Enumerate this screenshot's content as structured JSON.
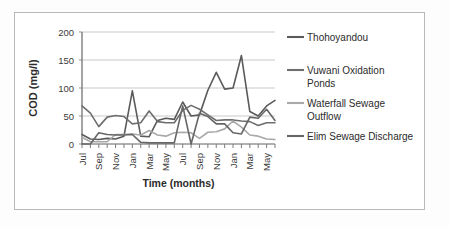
{
  "figure": {
    "background_color": "#ffffff",
    "frame_color": "#b9b9b9",
    "gridline_color": "#c9c9c9",
    "axis_color": "#8f8f8f"
  },
  "chart_data": {
    "type": "line",
    "title": "",
    "xlabel": "Time (months)",
    "ylabel": "COD (mg/l)",
    "ylim": [
      0,
      200
    ],
    "yticks": [
      0,
      50,
      100,
      150,
      200
    ],
    "grid": true,
    "legend_position": "right",
    "x": [
      "Jul",
      "Aug",
      "Sep",
      "Oct",
      "Nov",
      "Dec",
      "Jan",
      "Feb",
      "Mar",
      "Apr",
      "May",
      "Jun",
      "Jul",
      "Aug",
      "Sep",
      "Oct",
      "Nov",
      "Dec",
      "Jan",
      "Feb",
      "Mar",
      "Apr",
      "May",
      "Jun"
    ],
    "xtick_labels": [
      "Jul",
      "Sep",
      "Nov",
      "Jan",
      "Mar",
      "May",
      "Jul",
      "Sep",
      "Nov",
      "Jan",
      "Mar",
      "May"
    ],
    "xtick_indices": [
      0,
      2,
      4,
      6,
      8,
      10,
      12,
      14,
      16,
      18,
      20,
      22
    ],
    "series": [
      {
        "name": "Thohoyandou",
        "color": "#5a5a5a",
        "values": [
          17,
          9,
          8,
          10,
          9,
          14,
          95,
          14,
          13,
          42,
          46,
          44,
          75,
          50,
          52,
          96,
          128,
          98,
          100,
          158,
          58,
          50,
          68,
          78
        ]
      },
      {
        "name": "Vuwani Oxidation Ponds",
        "color": "#6e6e6e",
        "values": [
          68,
          55,
          31,
          48,
          51,
          49,
          36,
          38,
          59,
          40,
          38,
          38,
          60,
          69,
          62,
          52,
          42,
          43,
          43,
          41,
          40,
          33,
          38,
          38
        ]
      },
      {
        "name": "Waterfall Sewage Outflow",
        "color": "#a8a8a8",
        "values": [
          12,
          4,
          4,
          4,
          17,
          17,
          18,
          16,
          24,
          16,
          14,
          20,
          21,
          20,
          10,
          21,
          22,
          27,
          41,
          30,
          16,
          14,
          9,
          8
        ]
      },
      {
        "name": "Elim Sewage Discharge",
        "color": "#666666",
        "values": [
          0,
          0,
          20,
          17,
          16,
          16,
          17,
          3,
          2,
          2,
          2,
          2,
          68,
          0,
          55,
          49,
          36,
          36,
          20,
          18,
          48,
          46,
          62,
          42
        ]
      }
    ]
  },
  "legend": {
    "entries": [
      {
        "label": "Thohoyandou"
      },
      {
        "label": "Vuwani Oxidation",
        "label2": "Ponds"
      },
      {
        "label": "Waterfall Sewage",
        "label2": "Outflow"
      },
      {
        "label": "Elim Sewage Discharge"
      }
    ]
  }
}
